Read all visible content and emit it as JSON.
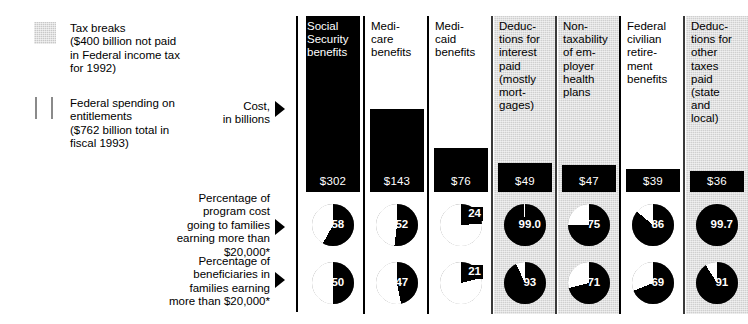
{
  "legend": {
    "items": [
      {
        "name": "tax-breaks",
        "swatch": "gray-square",
        "text": "Tax breaks\n($400 billion not paid\nin Federal income tax\nfor 1992)"
      },
      {
        "name": "federal-spending",
        "swatch": "white-bars",
        "text": "Federal spending on\nentitlements\n($762 billion total in\nfiscal 1993)"
      }
    ]
  },
  "row_captions": {
    "cost": "Cost,\nin billions",
    "percent_cost": "Percentage of\nprogram cost\ngoing to families\nearning more than\n$20,000*",
    "percent_beneficiaries": "Percentage of\nbeneficiaries in\nfamilies earning\nmore than $20,000*"
  },
  "chart_data": {
    "type": "bar",
    "title": "Cost, in billions",
    "xlabel": "",
    "ylabel": "Cost, in billions",
    "ylim": [
      0,
      302
    ],
    "categories": [
      "Social Security benefits",
      "Medicare benefits",
      "Medicaid benefits",
      "Deductions for interest paid (mostly mortgages)",
      "Non-taxability of employer health plans",
      "Federal civilian retirement benefits",
      "Deductions for other taxes paid (state and local)"
    ],
    "values": [
      302,
      143,
      76,
      49,
      47,
      39,
      36
    ],
    "value_labels": [
      "$302",
      "$143",
      "$76",
      "$49",
      "$47",
      "$39",
      "$36"
    ],
    "series": [
      {
        "name": "Cost, in billions",
        "values": [
          302,
          143,
          76,
          49,
          47,
          39,
          36
        ]
      },
      {
        "name": "Percentage of program cost going to families earning more than $20,000*",
        "values": [
          58,
          52,
          24,
          99.0,
          75,
          86,
          99.7
        ]
      },
      {
        "name": "Percentage of beneficiaries in families earning more than $20,000*",
        "values": [
          50,
          47,
          21,
          93,
          71,
          69,
          91
        ]
      }
    ]
  },
  "columns": [
    {
      "key": "social-security",
      "header": "Social\nSecurity\nbenefits",
      "shaded": false,
      "header_on_bar": true,
      "cost": 302,
      "cost_label": "$302",
      "pct_cost": 58,
      "pct_cost_label": "58",
      "pct_benef": 50,
      "pct_benef_label": "50"
    },
    {
      "key": "medicare",
      "header": "Medi-\ncare\nbenefits",
      "shaded": false,
      "header_on_bar": false,
      "cost": 143,
      "cost_label": "$143",
      "pct_cost": 52,
      "pct_cost_label": "52",
      "pct_benef": 47,
      "pct_benef_label": "47"
    },
    {
      "key": "medicaid",
      "header": "Medi-\ncaid\nbenefits",
      "shaded": false,
      "header_on_bar": false,
      "cost": 76,
      "cost_label": "$76",
      "pct_cost": 24,
      "pct_cost_label": "24",
      "pct_benef": 21,
      "pct_benef_label": "21"
    },
    {
      "key": "interest-deductions",
      "header": "Deduc-\ntions for\ninterest\npaid\n(mostly\nmort-\ngages)",
      "shaded": true,
      "header_on_bar": false,
      "cost": 49,
      "cost_label": "$49",
      "pct_cost": 99.0,
      "pct_cost_label": "99.0",
      "pct_benef": 93,
      "pct_benef_label": "93"
    },
    {
      "key": "employer-health",
      "header": "Non-\ntaxability\nof em-\nployer\nhealth\nplans",
      "shaded": true,
      "header_on_bar": false,
      "cost": 47,
      "cost_label": "$47",
      "pct_cost": 75,
      "pct_cost_label": "75",
      "pct_benef": 71,
      "pct_benef_label": "71"
    },
    {
      "key": "federal-civilian-retirement",
      "header": "Federal\ncivilian\nretire-\nment\nbenefits",
      "shaded": false,
      "header_on_bar": false,
      "cost": 39,
      "cost_label": "$39",
      "pct_cost": 86,
      "pct_cost_label": "86",
      "pct_benef": 69,
      "pct_benef_label": "69"
    },
    {
      "key": "other-taxes-deductions",
      "header": "Deduc-\ntions for\nother\ntaxes\npaid\n(state\nand\nlocal)",
      "shaded": true,
      "header_on_bar": false,
      "cost": 36,
      "cost_label": "$36",
      "pct_cost": 99.7,
      "pct_cost_label": "99.7",
      "pct_benef": 91,
      "pct_benef_label": "91"
    }
  ],
  "colors": {
    "ink": "#000000",
    "shade": "#cfcfcf",
    "pie_fill": "#000000",
    "pie_empty": "#ffffff"
  }
}
